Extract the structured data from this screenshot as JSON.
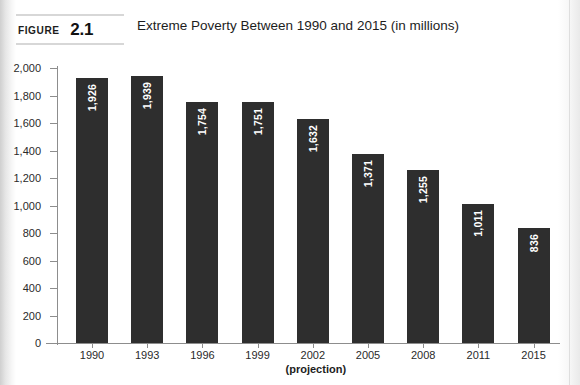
{
  "figure": {
    "label_word": "FIGURE",
    "label_number": "2.1",
    "title": "Extreme Poverty Between 1990 and 2015 (in millions)"
  },
  "axis_note": "(projection)",
  "chart_data": {
    "type": "bar",
    "title": "Extreme Poverty Between 1990 and 2015 (in millions)",
    "xlabel": "",
    "ylabel": "",
    "ylim": [
      0,
      2000
    ],
    "ytick_step": 200,
    "grid": false,
    "legend": "none",
    "bar_color": "#2e2e2e",
    "value_label_color": "#ffffff",
    "value_label_orientation": "vertical",
    "categories": [
      "1990",
      "1993",
      "1996",
      "1999",
      "2002",
      "2005",
      "2008",
      "2011",
      "2015"
    ],
    "values": [
      1926,
      1939,
      1754,
      1751,
      1632,
      1371,
      1255,
      1011,
      836
    ],
    "value_labels": [
      "1,926",
      "1,939",
      "1,754",
      "1,751",
      "1,632",
      "1,371",
      "1,255",
      "1,011",
      "836"
    ],
    "ytick_labels": [
      "2,000",
      "1,800",
      "1,600",
      "1,400",
      "1,200",
      "1,000",
      "800",
      "600",
      "400",
      "200",
      "0"
    ],
    "ytick_values": [
      2000,
      1800,
      1600,
      1400,
      1200,
      1000,
      800,
      600,
      400,
      200,
      0
    ],
    "annotations": [
      {
        "text": "(projection)",
        "under_category": "2002"
      }
    ]
  }
}
